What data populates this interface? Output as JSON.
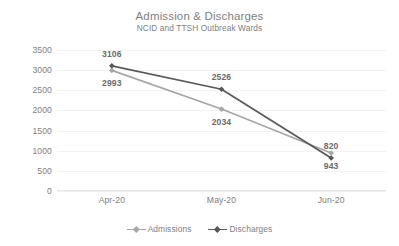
{
  "chart_data": {
    "type": "line",
    "title": "Admission & Discharges",
    "subtitle": "NCID and TTSH Outbreak Wards",
    "xlabel": "",
    "ylabel": "",
    "categories": [
      "Apr-20",
      "May-20",
      "Jun-20"
    ],
    "ylim": [
      0,
      3500
    ],
    "yticks": [
      0,
      500,
      1000,
      1500,
      2000,
      2500,
      3000,
      3500
    ],
    "ytick_labels": [
      "0",
      "500",
      "1000",
      "1500",
      "2000",
      "2500",
      "3000",
      "3500"
    ],
    "grid": true,
    "legend_position": "bottom",
    "series": [
      {
        "name": "Admissions",
        "color": "#a6a6a6",
        "values": [
          2993,
          2034,
          943
        ],
        "labels": [
          "2993",
          "2034",
          "943"
        ],
        "label_positions": [
          "below",
          "below",
          "below"
        ]
      },
      {
        "name": "Discharges",
        "color": "#595959",
        "values": [
          3106,
          2526,
          820
        ],
        "labels": [
          "3106",
          "2526",
          "820"
        ],
        "label_positions": [
          "above",
          "above",
          "above"
        ]
      }
    ]
  },
  "legend": {
    "items": [
      {
        "label": "Admissions",
        "color": "#a6a6a6"
      },
      {
        "label": "Discharges",
        "color": "#595959"
      }
    ]
  }
}
